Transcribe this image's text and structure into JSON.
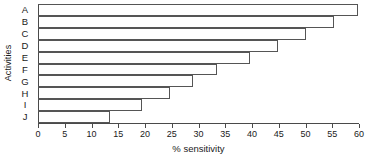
{
  "chart_data": {
    "type": "bar",
    "orientation": "horizontal",
    "title": "",
    "xlabel": "% sensitivity",
    "ylabel": "Activities",
    "categories": [
      "A",
      "B",
      "C",
      "D",
      "E",
      "F",
      "G",
      "H",
      "I",
      "J"
    ],
    "values": [
      60,
      55.5,
      50.3,
      45,
      39.7,
      33.5,
      29,
      24.8,
      19.5,
      13.5
    ],
    "xlim": [
      0,
      60
    ],
    "xticks": [
      0,
      5,
      10,
      15,
      20,
      25,
      30,
      35,
      40,
      45,
      50,
      55,
      60
    ],
    "xtick_labels": [
      "0",
      "5",
      "10",
      "15",
      "20",
      "25",
      "30",
      "35",
      "40",
      "45",
      "50",
      "55",
      "60"
    ],
    "grid": false,
    "legend": null,
    "bar_fill": "none",
    "bar_edge_color": "#555555",
    "axis_color": "#4a4a4a",
    "background": "#ffffff"
  }
}
